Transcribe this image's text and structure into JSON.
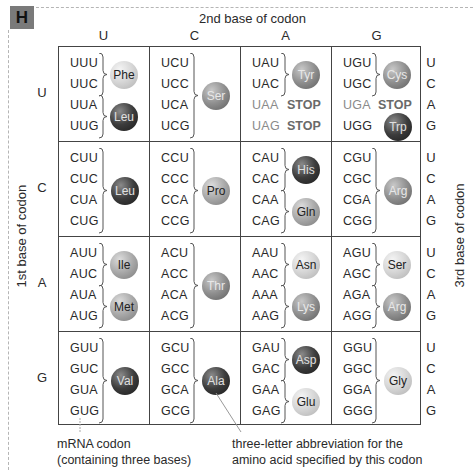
{
  "figure_label": "H",
  "axis": {
    "second_base_title": "2nd base of codon",
    "first_base_title": "1st base of codon",
    "third_base_title": "3rd base of codon"
  },
  "bases": [
    "U",
    "C",
    "A",
    "G"
  ],
  "rows": [
    {
      "first_base": "U",
      "cells": [
        {
          "codons": [
            "UUU",
            "UUC",
            "UUA",
            "UUG"
          ],
          "groups": [
            {
              "aa": "Phe",
              "span": [
                0,
                1
              ],
              "shade": "light"
            },
            {
              "aa": "Leu",
              "span": [
                2,
                3
              ],
              "shade": "dark"
            }
          ]
        },
        {
          "codons": [
            "UCU",
            "UCC",
            "UCA",
            "UCG"
          ],
          "groups": [
            {
              "aa": "Ser",
              "span": [
                0,
                3
              ],
              "shade": "mid"
            }
          ]
        },
        {
          "codons": [
            "UAU",
            "UAC",
            "UAA",
            "UAG"
          ],
          "stop": [
            null,
            null,
            "STOP",
            "STOP"
          ],
          "groups": [
            {
              "aa": "Tyr",
              "span": [
                0,
                1
              ],
              "shade": "mid"
            }
          ]
        },
        {
          "codons": [
            "UGU",
            "UGC",
            "UGA",
            "UGG"
          ],
          "stop": [
            null,
            null,
            "STOP",
            null
          ],
          "groups": [
            {
              "aa": "Cys",
              "span": [
                0,
                1
              ],
              "shade": "mid"
            },
            {
              "aa": "Trp",
              "span": [
                3,
                3
              ],
              "shade": "dark"
            }
          ]
        }
      ]
    },
    {
      "first_base": "C",
      "cells": [
        {
          "codons": [
            "CUU",
            "CUC",
            "CUA",
            "CUG"
          ],
          "groups": [
            {
              "aa": "Leu",
              "span": [
                0,
                3
              ],
              "shade": "dark"
            }
          ]
        },
        {
          "codons": [
            "CCU",
            "CCC",
            "CCA",
            "CCG"
          ],
          "groups": [
            {
              "aa": "Pro",
              "span": [
                0,
                3
              ],
              "shade": "midlight"
            }
          ]
        },
        {
          "codons": [
            "CAU",
            "CAC",
            "CAA",
            "CAG"
          ],
          "groups": [
            {
              "aa": "His",
              "span": [
                0,
                1
              ],
              "shade": "dark"
            },
            {
              "aa": "Gln",
              "span": [
                2,
                3
              ],
              "shade": "midlight"
            }
          ]
        },
        {
          "codons": [
            "CGU",
            "CGC",
            "CGA",
            "CGG"
          ],
          "groups": [
            {
              "aa": "Arg",
              "span": [
                0,
                3
              ],
              "shade": "mid"
            }
          ]
        }
      ]
    },
    {
      "first_base": "A",
      "cells": [
        {
          "codons": [
            "AUU",
            "AUC",
            "AUA",
            "AUG"
          ],
          "groups": [
            {
              "aa": "Ile",
              "span": [
                0,
                1
              ],
              "shade": "midlight"
            },
            {
              "aa": "Met",
              "span": [
                2,
                3
              ],
              "shade": "midlight"
            }
          ]
        },
        {
          "codons": [
            "ACU",
            "ACC",
            "ACA",
            "ACG"
          ],
          "groups": [
            {
              "aa": "Thr",
              "span": [
                0,
                3
              ],
              "shade": "mid"
            }
          ]
        },
        {
          "codons": [
            "AAU",
            "AAC",
            "AAA",
            "AAG"
          ],
          "groups": [
            {
              "aa": "Asn",
              "span": [
                0,
                1
              ],
              "shade": "light"
            },
            {
              "aa": "Lys",
              "span": [
                2,
                3
              ],
              "shade": "mid"
            }
          ]
        },
        {
          "codons": [
            "AGU",
            "AGC",
            "AGA",
            "AGG"
          ],
          "groups": [
            {
              "aa": "Ser",
              "span": [
                0,
                1
              ],
              "shade": "light"
            },
            {
              "aa": "Arg",
              "span": [
                2,
                3
              ],
              "shade": "mid"
            }
          ]
        }
      ]
    },
    {
      "first_base": "G",
      "cells": [
        {
          "codons": [
            "GUU",
            "GUC",
            "GUA",
            "GUG"
          ],
          "groups": [
            {
              "aa": "Val",
              "span": [
                0,
                3
              ],
              "shade": "dark"
            }
          ]
        },
        {
          "codons": [
            "GCU",
            "GCC",
            "GCA",
            "GCG"
          ],
          "groups": [
            {
              "aa": "Ala",
              "span": [
                0,
                3
              ],
              "shade": "dark"
            }
          ]
        },
        {
          "codons": [
            "GAU",
            "GAC",
            "GAA",
            "GAG"
          ],
          "groups": [
            {
              "aa": "Asp",
              "span": [
                0,
                1
              ],
              "shade": "dark"
            },
            {
              "aa": "Glu",
              "span": [
                2,
                3
              ],
              "shade": "light"
            }
          ]
        },
        {
          "codons": [
            "GGU",
            "GGC",
            "GGA",
            "GGG"
          ],
          "groups": [
            {
              "aa": "Gly",
              "span": [
                0,
                3
              ],
              "shade": "light"
            }
          ]
        }
      ]
    }
  ],
  "captions": {
    "codon_label_line1": "mRNA codon",
    "codon_label_line2": "(containing three bases)",
    "aa_label_line1": "three-letter abbreviation for the",
    "aa_label_line2": "amino acid specified by this codon"
  }
}
